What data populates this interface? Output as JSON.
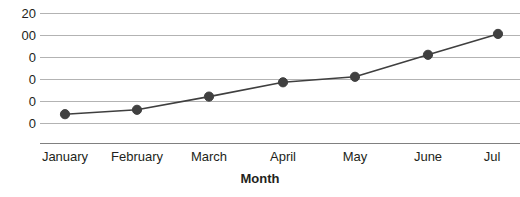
{
  "chart_data": {
    "type": "line",
    "title": "",
    "subtitle": "",
    "xlabel": "Month",
    "ylabel": "",
    "categories": [
      "January",
      "February",
      "March",
      "April",
      "May",
      "June",
      "July"
    ],
    "tick_labels_x": [
      "January",
      "February",
      "March",
      "April",
      "May",
      "June",
      "Jul"
    ],
    "values": [
      28,
      32,
      44,
      57,
      62,
      82,
      101
    ],
    "series": [
      {
        "name": "",
        "values": [
          28,
          32,
          44,
          57,
          62,
          82,
          101
        ]
      }
    ],
    "ylim": [
      20,
      120
    ],
    "yticks": [
      120,
      100,
      80,
      60,
      40,
      20
    ],
    "ytick_labels": [
      "20",
      "00",
      "0",
      "0",
      "0",
      "0"
    ],
    "grid": true,
    "grid_axis": "y",
    "legend": false,
    "legend_position": "none",
    "marker": "circle",
    "line_color": "#3f3f3f",
    "marker_color": "#404040",
    "grid_color": "#b3b3b3",
    "axis_color": "#808080",
    "text_color": "#231f20",
    "background": "#ffffff"
  },
  "axis": {
    "x_title": "Month"
  }
}
